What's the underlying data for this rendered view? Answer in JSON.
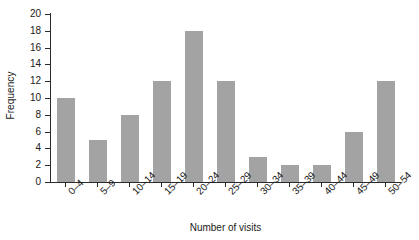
{
  "chart_data": {
    "type": "bar",
    "title": "",
    "xlabel": "Number of visits",
    "ylabel": "Frequency",
    "categories": [
      "0–4",
      "5–9",
      "10–14",
      "15–19",
      "20–24",
      "25–29",
      "30–34",
      "35–39",
      "40–44",
      "45–49",
      "50–54"
    ],
    "values": [
      10,
      5,
      8,
      12,
      18,
      12,
      3,
      2,
      2,
      6,
      12
    ],
    "ylim": [
      0,
      20
    ],
    "ytick_step": 2,
    "yticks": [
      0,
      2,
      4,
      6,
      8,
      10,
      12,
      14,
      16,
      18,
      20
    ],
    "ytick_labels": [
      "0",
      "2",
      "4",
      "6",
      "8",
      "10",
      "12",
      "14",
      "16",
      "18",
      "20"
    ],
    "grid": false,
    "legend": false,
    "legend_position": "none",
    "bar_color": "#a3a3a3",
    "axis_color": "#2b2b2b",
    "background_color": "#ffffff",
    "xtick_label_rotation": -45
  }
}
